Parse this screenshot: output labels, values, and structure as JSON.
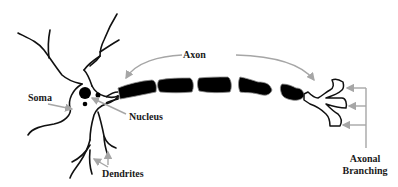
{
  "diagram": {
    "labels": {
      "axon": "Axon",
      "soma": "Soma",
      "nucleus": "Nucleus",
      "dendrites": "Dendrites",
      "axonal_branching_line1": "Axonal",
      "axonal_branching_line2": "Branching"
    },
    "colors": {
      "outline": "#111111",
      "axon_fill": "#000000",
      "arrow": "#a6a6a6",
      "background": "#ffffff",
      "text": "#1a1a1a"
    },
    "axon_segment_count": 5
  }
}
